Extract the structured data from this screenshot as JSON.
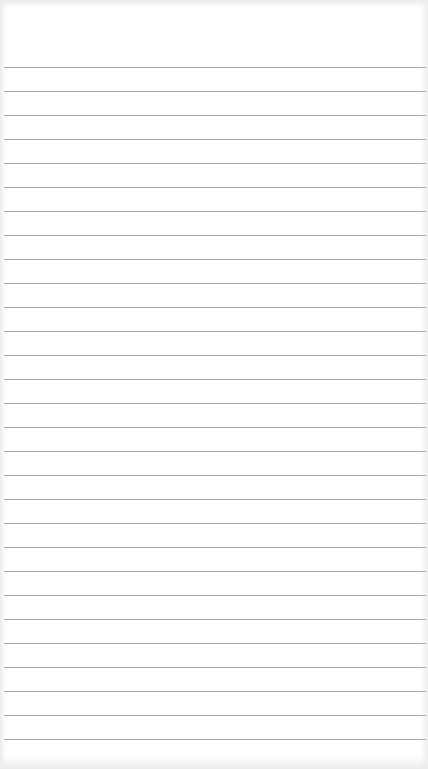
{
  "paper": {
    "type": "lined-paper",
    "line_count": 29,
    "first_line_y": 67,
    "line_spacing": 24,
    "line_color": "#9a9a9a",
    "background_color": "#ffffff"
  }
}
